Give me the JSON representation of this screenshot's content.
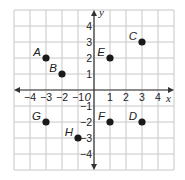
{
  "chart_data": {
    "type": "scatter",
    "title": "",
    "xlabel": "x",
    "ylabel": "y",
    "xlim": [
      -5,
      5
    ],
    "ylim": [
      -5,
      5
    ],
    "grid": true,
    "origin_label": "0",
    "x_ticks": [
      -4,
      -3,
      -2,
      -1,
      1,
      2,
      3,
      4
    ],
    "y_ticks": [
      -4,
      -3,
      -2,
      -1,
      1,
      2,
      3,
      4
    ],
    "points": [
      {
        "label": "A",
        "x": -3,
        "y": 2
      },
      {
        "label": "B",
        "x": -2,
        "y": 1
      },
      {
        "label": "C",
        "x": 3,
        "y": 3
      },
      {
        "label": "D",
        "x": 3,
        "y": -2
      },
      {
        "label": "E",
        "x": 1,
        "y": 2
      },
      {
        "label": "F",
        "x": 1,
        "y": -2
      },
      {
        "label": "G",
        "x": -3,
        "y": -2
      },
      {
        "label": "H",
        "x": -1,
        "y": -3
      }
    ]
  },
  "colors": {
    "grid": "#c8c8c8",
    "axis": "#333333",
    "point": "#1a1a1a"
  }
}
